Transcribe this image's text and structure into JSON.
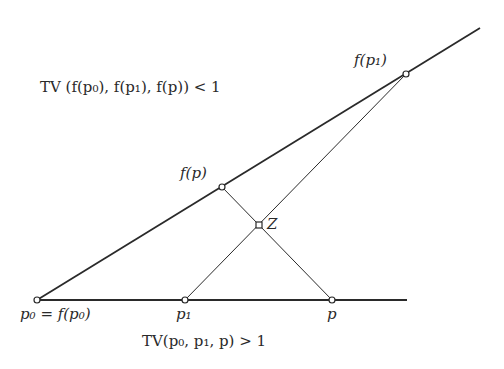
{
  "diagram": {
    "points": {
      "p0": {
        "x": 37,
        "y": 300
      },
      "p1": {
        "x": 185,
        "y": 300
      },
      "p": {
        "x": 332,
        "y": 300
      },
      "fp": {
        "x": 222,
        "y": 187
      },
      "fp1": {
        "x": 406,
        "y": 74
      },
      "Z": {
        "x": 259,
        "y": 225
      }
    },
    "labels": {
      "p0": "p₀ = f(p₀)",
      "p1": "p₁",
      "p": "p",
      "fp": "f(p)",
      "fp1": "f(p₁)",
      "Z": "Z"
    },
    "captions": {
      "top": "TV (f(p₀), f(p₁), f(p)) < 1",
      "bottom": "TV(p₀, p₁, p) > 1"
    },
    "colors": {
      "line": "#2a2a2a",
      "text": "#2a2a2a",
      "background": "#ffffff"
    }
  }
}
